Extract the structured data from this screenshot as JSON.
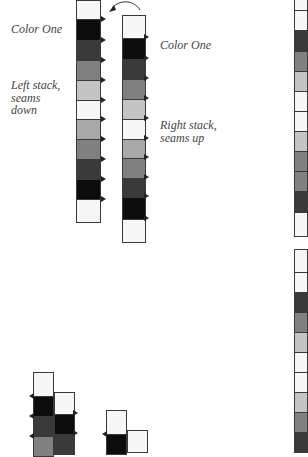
{
  "labels": {
    "left_color": "Color One",
    "left_stack": [
      "Left stack,",
      "seams",
      "down"
    ],
    "right_color": "Color One",
    "right_stack": [
      "Right stack,",
      "seams up"
    ]
  },
  "colors": {
    "white": "#f7f7f7",
    "black": "#0c0c0c",
    "dark": "#3a3a3a",
    "mid": "#808080",
    "light": "#c4c4c4",
    "lightmid": "#a8a8a8",
    "border": "#3a3a3a"
  },
  "stacks": [
    {
      "name": "left-stack",
      "x": 76,
      "w": 25,
      "notch": "right-out",
      "cells": [
        {
          "y": 0,
          "h": 19,
          "c": "white"
        },
        {
          "y": 19,
          "h": 21,
          "c": "black"
        },
        {
          "y": 40,
          "h": 20,
          "c": "dark"
        },
        {
          "y": 60,
          "h": 20,
          "c": "mid"
        },
        {
          "y": 80,
          "h": 20,
          "c": "light"
        },
        {
          "y": 100,
          "h": 19,
          "c": "white"
        },
        {
          "y": 119,
          "h": 20,
          "c": "lightmid"
        },
        {
          "y": 139,
          "h": 20,
          "c": "mid"
        },
        {
          "y": 159,
          "h": 20,
          "c": "dark"
        },
        {
          "y": 179,
          "h": 20,
          "c": "black"
        },
        {
          "y": 199,
          "h": 23,
          "c": "white"
        }
      ]
    },
    {
      "name": "right-stack",
      "x": 122,
      "w": 24,
      "notch": "right-in",
      "cells": [
        {
          "y": 15,
          "h": 23,
          "c": "white"
        },
        {
          "y": 38,
          "h": 21,
          "c": "black"
        },
        {
          "y": 59,
          "h": 20,
          "c": "dark"
        },
        {
          "y": 79,
          "h": 20,
          "c": "mid"
        },
        {
          "y": 99,
          "h": 20,
          "c": "light"
        },
        {
          "y": 119,
          "h": 20,
          "c": "white"
        },
        {
          "y": 139,
          "h": 19,
          "c": "lightmid"
        },
        {
          "y": 158,
          "h": 20,
          "c": "mid"
        },
        {
          "y": 178,
          "h": 19,
          "c": "dark"
        },
        {
          "y": 197,
          "h": 22,
          "c": "black"
        },
        {
          "y": 219,
          "h": 23,
          "c": "white"
        }
      ]
    },
    {
      "name": "edge-strip-top",
      "x": 294,
      "w": 14,
      "notch": "none",
      "cells": [
        {
          "y": -4,
          "h": 14,
          "c": "white"
        },
        {
          "y": 10,
          "h": 20,
          "c": "white"
        },
        {
          "y": 30,
          "h": 21,
          "c": "dark"
        },
        {
          "y": 51,
          "h": 20,
          "c": "mid"
        },
        {
          "y": 71,
          "h": 20,
          "c": "light"
        },
        {
          "y": 91,
          "h": 20,
          "c": "white"
        },
        {
          "y": 111,
          "h": 20,
          "c": "white"
        },
        {
          "y": 131,
          "h": 20,
          "c": "light"
        },
        {
          "y": 151,
          "h": 20,
          "c": "mid"
        },
        {
          "y": 171,
          "h": 20,
          "c": "mid"
        },
        {
          "y": 191,
          "h": 21,
          "c": "dark"
        },
        {
          "y": 212,
          "h": 24,
          "c": "white"
        }
      ]
    },
    {
      "name": "edge-strip-bottom",
      "x": 294,
      "w": 14,
      "notch": "none",
      "cells": [
        {
          "y": 249,
          "h": 23,
          "c": "white"
        },
        {
          "y": 272,
          "h": 20,
          "c": "white"
        },
        {
          "y": 292,
          "h": 20,
          "c": "dark"
        },
        {
          "y": 312,
          "h": 20,
          "c": "mid"
        },
        {
          "y": 332,
          "h": 20,
          "c": "light"
        },
        {
          "y": 352,
          "h": 20,
          "c": "white"
        },
        {
          "y": 372,
          "h": 20,
          "c": "white"
        },
        {
          "y": 392,
          "h": 20,
          "c": "light"
        },
        {
          "y": 412,
          "h": 20,
          "c": "mid"
        },
        {
          "y": 432,
          "h": 20,
          "c": "dark"
        }
      ]
    },
    {
      "name": "bottom-stack-a",
      "x": 33,
      "w": 21,
      "notch": "left-out",
      "cells": [
        {
          "y": 372,
          "h": 24,
          "c": "white"
        },
        {
          "y": 396,
          "h": 20,
          "c": "black"
        },
        {
          "y": 416,
          "h": 20,
          "c": "dark"
        },
        {
          "y": 436,
          "h": 20,
          "c": "mid"
        }
      ]
    },
    {
      "name": "bottom-stack-b",
      "x": 54,
      "w": 21,
      "notch": "right-in",
      "cells": [
        {
          "y": 392,
          "h": 22,
          "c": "white"
        },
        {
          "y": 414,
          "h": 20,
          "c": "black"
        },
        {
          "y": 434,
          "h": 20,
          "c": "dark"
        }
      ]
    },
    {
      "name": "bottom-stack-c",
      "x": 106,
      "w": 21,
      "notch": "left-out",
      "cells": [
        {
          "y": 410,
          "h": 24,
          "c": "white"
        },
        {
          "y": 434,
          "h": 20,
          "c": "black"
        }
      ]
    },
    {
      "name": "bottom-stack-d",
      "x": 127,
      "w": 21,
      "notch": "none",
      "cells": [
        {
          "y": 430,
          "h": 22,
          "c": "white"
        }
      ]
    }
  ]
}
